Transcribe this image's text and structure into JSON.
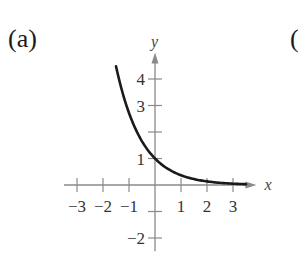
{
  "panel": {
    "label": "(a)",
    "next_label": "("
  },
  "chart_data": {
    "type": "line",
    "title": "",
    "function": "y = e^(-x)",
    "xlabel": "x",
    "ylabel": "y",
    "xlim": [
      -3.5,
      3.9
    ],
    "ylim": [
      -2.5,
      5.0
    ],
    "x_ticks": [
      -3,
      -2,
      -1,
      1,
      2,
      3
    ],
    "y_ticks": [
      -2,
      -1,
      1,
      2,
      3,
      4
    ],
    "x_tick_labels": [
      "−3",
      "−2",
      "−1",
      "1",
      "2",
      "3"
    ],
    "y_tick_labels": [
      "−2",
      "1",
      "3",
      "4"
    ],
    "grid": false,
    "legend": null,
    "series": [
      {
        "name": "curve",
        "x": [
          -1.5,
          -1.25,
          -1.0,
          -0.75,
          -0.5,
          -0.25,
          0,
          0.5,
          1.0,
          1.5,
          2.0,
          2.5,
          3.0,
          3.5
        ],
        "y": [
          4.48,
          3.49,
          2.72,
          2.12,
          1.65,
          1.28,
          1.0,
          0.61,
          0.37,
          0.22,
          0.14,
          0.08,
          0.05,
          0.03
        ]
      }
    ],
    "colors": {
      "curve": "#1a1a1a",
      "axes": "#8a8a8a",
      "text": "#333333"
    }
  }
}
